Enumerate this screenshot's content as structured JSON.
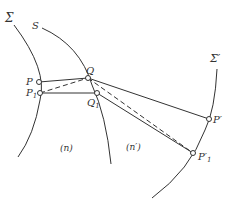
{
  "diagram": {
    "surfaces": {
      "sigma": "Σ",
      "s": "S",
      "sigma_prime": "Σ′"
    },
    "points": {
      "p": "P",
      "p1": "P",
      "p1_sub": "1",
      "q": "Q",
      "q1": "Q",
      "q1_sub": "1",
      "p_prime": "P′",
      "p1_prime": "P′",
      "p1_prime_sub": "1"
    },
    "media": {
      "n": "(n)",
      "n_prime": "(n′)"
    },
    "colors": {
      "line": "#333333",
      "background": "#ffffff"
    }
  }
}
